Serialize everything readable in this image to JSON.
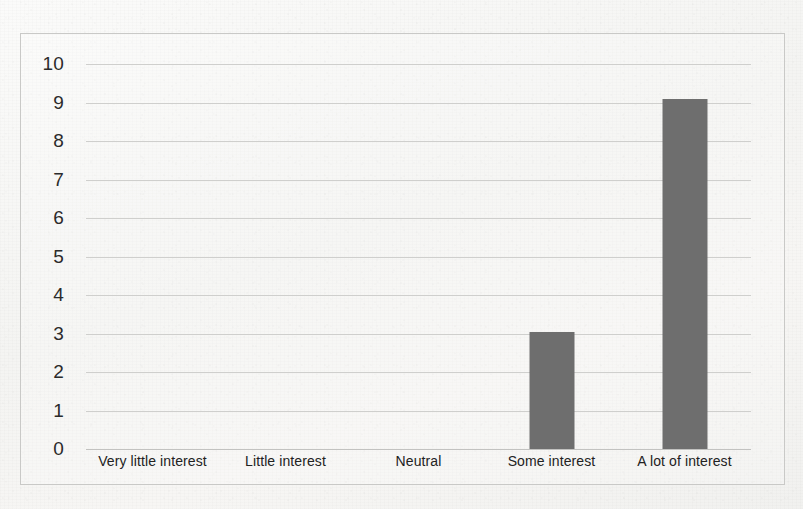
{
  "chart_data": {
    "type": "bar",
    "title": "",
    "xlabel": "",
    "ylabel": "",
    "categories": [
      "Very little interest",
      "Little interest",
      "Neutral",
      "Some interest",
      "A lot of interest"
    ],
    "values": [
      0,
      0,
      0,
      3.05,
      9.1
    ],
    "ylim": [
      0,
      10
    ],
    "ytick_labels": [
      "10",
      "9",
      "8",
      "7",
      "6",
      "5",
      "4",
      "3",
      "2",
      "1",
      "0"
    ],
    "ytick_values": [
      10,
      9,
      8,
      7,
      6,
      5,
      4,
      3,
      2,
      1,
      0
    ],
    "grid": true,
    "legend": false,
    "bar_color": "#6e6e6e",
    "gridline_color": "#cfcfcd",
    "background_color": "#f5f5f3",
    "frame_color": "#c9c9c7"
  }
}
